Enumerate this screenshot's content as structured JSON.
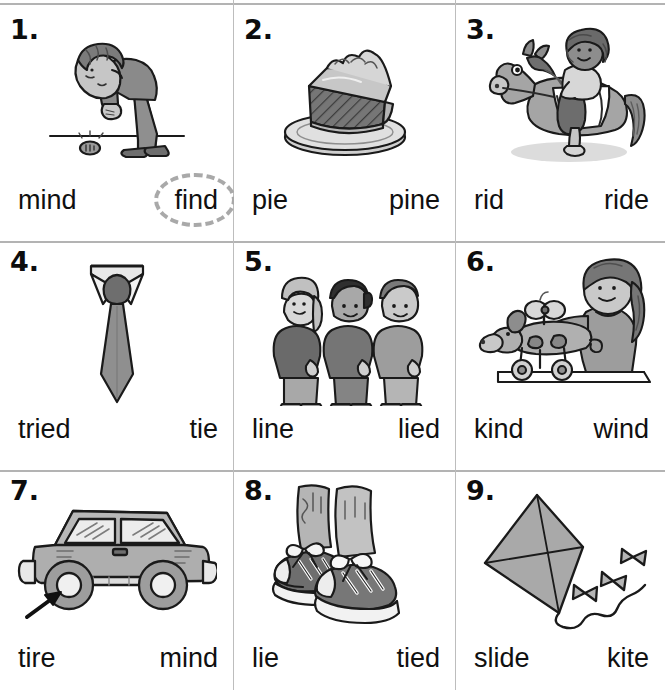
{
  "worksheet": {
    "title": "Long i word picture worksheet",
    "rows": 3,
    "columns": 3,
    "circled_color": "#a9a9a9",
    "rule_color": "#b3b3b3"
  },
  "items": [
    {
      "number": "1.",
      "picture": "boy-finding-coin",
      "picture_alt": "Boy bending over to pick up a coin on the ground",
      "left_word": "mind",
      "right_word": "find",
      "circled": "right"
    },
    {
      "number": "2.",
      "picture": "slice-of-pie",
      "picture_alt": "Slice of pie with whipped topping on a plate",
      "left_word": "pie",
      "right_word": "pine",
      "circled": "none"
    },
    {
      "number": "3.",
      "picture": "child-riding-horse",
      "picture_alt": "Child riding a horse",
      "left_word": "rid",
      "right_word": "ride",
      "circled": "none"
    },
    {
      "number": "4.",
      "picture": "necktie",
      "picture_alt": "Necktie with collar",
      "left_word": "tried",
      "right_word": "tie",
      "circled": "none"
    },
    {
      "number": "5.",
      "picture": "children-in-line",
      "picture_alt": "Three children standing in a line",
      "left_word": "line",
      "right_word": "lied",
      "circled": "none"
    },
    {
      "number": "6.",
      "picture": "girl-winding-toy-dog",
      "picture_alt": "Girl winding up a toy dog on wheels",
      "left_word": "kind",
      "right_word": "wind",
      "circled": "none"
    },
    {
      "number": "7.",
      "picture": "car-with-tire-arrow",
      "picture_alt": "Car with an arrow pointing at the front tire",
      "left_word": "tire",
      "right_word": "mind",
      "circled": "none"
    },
    {
      "number": "8.",
      "picture": "tied-sneakers",
      "picture_alt": "Pair of sneakers with tied laces",
      "left_word": "lie",
      "right_word": "tied",
      "circled": "none"
    },
    {
      "number": "9.",
      "picture": "kite",
      "picture_alt": "Diamond kite with a bow tail",
      "left_word": "slide",
      "right_word": "kite",
      "circled": "none"
    }
  ]
}
